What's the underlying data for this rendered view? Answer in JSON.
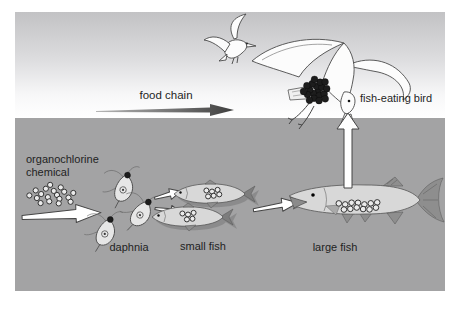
{
  "labels": {
    "food_chain": "food chain"
  },
  "stages": [
    {
      "id": "chemical",
      "label": "organochlorine chemical",
      "label_lines": [
        "organochlorine",
        "chemical"
      ],
      "particles": 18
    },
    {
      "id": "daphnia",
      "label": "daphnia",
      "organisms": 3,
      "particles_each": 1
    },
    {
      "id": "small_fish",
      "label": "small fish",
      "organisms": 2,
      "particles": [
        6,
        5
      ]
    },
    {
      "id": "large_fish",
      "label": "large fish",
      "organisms": 1,
      "particles": 13
    },
    {
      "id": "bird",
      "label": "fish-eating bird",
      "organisms": 1,
      "particles": 19
    }
  ],
  "flow": [
    {
      "from": "organochlorine chemical",
      "to": "daphnia"
    },
    {
      "from": "daphnia",
      "to": "small fish"
    },
    {
      "from": "small fish",
      "to": "large fish"
    },
    {
      "from": "large fish",
      "to": "fish-eating bird"
    }
  ],
  "colors": {
    "sky_top": "#c2c2c4",
    "sky_bottom": "#ffffff",
    "water": "#a3a3a4",
    "outline": "#454545",
    "bird_fill": "#fcfcfc",
    "fish_fill": "#d8d8d8",
    "fin_dark": "#8e8e8e",
    "arrow_fill": "#ffffff",
    "food_arrow_start": "#b6b6b6",
    "food_arrow_end": "#3e3e3e",
    "particle": "#1d1d1d",
    "particle_ring": "#ebebeb",
    "text": "#1f1f1f"
  }
}
